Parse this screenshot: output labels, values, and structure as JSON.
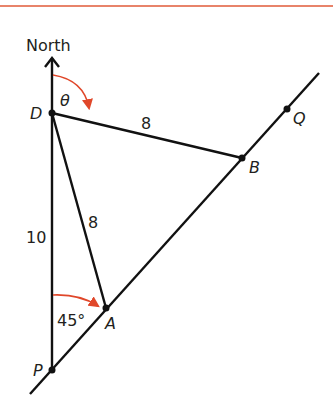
{
  "header_rule": {
    "color": "#e8836a"
  },
  "colors": {
    "line": "#111111",
    "arc": "#e0472a",
    "text": "#231f20"
  },
  "labels": {
    "north": "North",
    "theta": "θ",
    "D": "D",
    "B": "B",
    "Q": "Q",
    "A": "A",
    "P": "P",
    "DB_length": "8",
    "DA_length": "8",
    "DP_length": "10",
    "angle_P": "45°"
  },
  "points": {
    "D": [
      52,
      113
    ],
    "P": [
      52,
      370
    ],
    "A": [
      106,
      308
    ],
    "B": [
      242,
      158
    ],
    "Q": [
      287,
      109
    ]
  }
}
